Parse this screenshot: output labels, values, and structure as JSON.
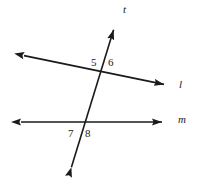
{
  "figure": {
    "kind": "two-parallel-lines-cut-by-transversal",
    "background_color": "#ffffff",
    "stroke_color": "#1a1a1a",
    "labels": {
      "angle_5": "5",
      "angle_6": "6",
      "angle_7": "7",
      "angle_8": "8",
      "line_t": "t",
      "line_l": "l",
      "line_m": "m"
    },
    "lines": [
      {
        "name": "line-l",
        "label": "l",
        "from": [
          16,
          54
        ],
        "to": [
          172,
          86
        ],
        "arrows": "both"
      },
      {
        "name": "line-m",
        "label": "m",
        "from": [
          13,
          122
        ],
        "to": [
          170,
          122
        ],
        "arrows": "both"
      },
      {
        "name": "transversal-t",
        "label": "t",
        "from": [
          69,
          175
        ],
        "to": [
          116,
          22
        ],
        "arrows": "both"
      }
    ],
    "intersections": [
      {
        "name": "intersection-l-t",
        "x": 103,
        "y": 72
      },
      {
        "name": "intersection-m-t",
        "x": 85,
        "y": 122
      }
    ]
  }
}
